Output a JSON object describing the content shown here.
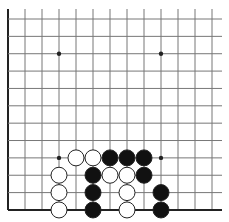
{
  "board": {
    "description": "Go board corner (bottom-left) diagram",
    "origin_x": 8,
    "origin_y": 19,
    "spacing_x": 17,
    "spacing_y": 17.36,
    "cols": 13,
    "rows": 12,
    "line_extent_right": 222,
    "left_edge_bold": true,
    "bottom_edge_bold": true,
    "stone_radius": 8,
    "colors": {
      "background": "#ffffff",
      "line": "#777777",
      "edge": "#222222",
      "black_stone": "#111111",
      "white_stone": "#ffffff",
      "stone_outline": "#222222"
    },
    "star_points": [
      {
        "col": 3,
        "row": 2
      },
      {
        "col": 9,
        "row": 2
      },
      {
        "col": 3,
        "row": 8
      },
      {
        "col": 9,
        "row": 8
      }
    ],
    "stones": [
      {
        "color": "white",
        "col": 4,
        "row": 8
      },
      {
        "color": "white",
        "col": 5,
        "row": 8
      },
      {
        "color": "black",
        "col": 6,
        "row": 8
      },
      {
        "color": "black",
        "col": 7,
        "row": 8
      },
      {
        "color": "black",
        "col": 8,
        "row": 8
      },
      {
        "color": "white",
        "col": 3,
        "row": 9
      },
      {
        "color": "black",
        "col": 5,
        "row": 9
      },
      {
        "color": "white",
        "col": 6,
        "row": 9
      },
      {
        "color": "white",
        "col": 7,
        "row": 9
      },
      {
        "color": "black",
        "col": 8,
        "row": 9
      },
      {
        "color": "white",
        "col": 3,
        "row": 10
      },
      {
        "color": "black",
        "col": 5,
        "row": 10
      },
      {
        "color": "white",
        "col": 7,
        "row": 10
      },
      {
        "color": "black",
        "col": 9,
        "row": 10
      },
      {
        "color": "white",
        "col": 3,
        "row": 11
      },
      {
        "color": "black",
        "col": 5,
        "row": 11
      },
      {
        "color": "white",
        "col": 7,
        "row": 11
      },
      {
        "color": "black",
        "col": 9,
        "row": 11
      }
    ]
  }
}
